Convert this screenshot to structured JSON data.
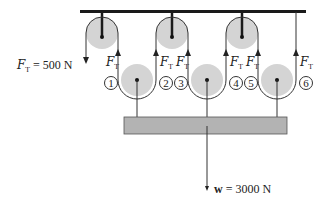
{
  "colors": {
    "pulley": "#d4d4d4",
    "rope": "#333333",
    "bar": "#1a1a1a",
    "platform": "#b3b3b3"
  },
  "labels": {
    "tension_left": {
      "symbol": "F",
      "sub": "T",
      "value": " = 500 N"
    },
    "tension": {
      "symbol": "F",
      "sub": "T"
    },
    "weight": {
      "symbol": "w",
      "value": " = 3000 N"
    }
  },
  "segments": [
    "1",
    "2",
    "3",
    "4",
    "5",
    "6"
  ]
}
